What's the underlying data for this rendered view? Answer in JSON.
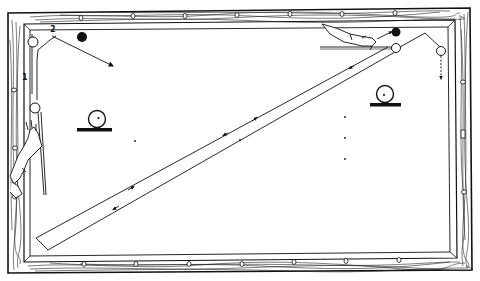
{
  "diagram": {
    "type": "billiard-table-shot-illustration",
    "colors": {
      "ink": "#111111",
      "background": "#ffffff",
      "rail_wood": "#ffffff",
      "grain": "#222222"
    },
    "labels": {
      "path_1": "1",
      "path_2": "2"
    },
    "elements": {
      "table": "billiard-table",
      "rails": "wooden-rails",
      "diamonds_top": 9,
      "diamonds_bottom": 9,
      "diamonds_left": 3,
      "diamonds_right": 3,
      "spot_markers": [
        "head-spot",
        "foot-spot",
        "center-spot",
        "side-spots"
      ],
      "balls": [
        "white-cue-ball-left",
        "black-object-ball-top-left",
        "white-ball-top-right",
        "black-ball-top-right",
        "white-ball-right-rail"
      ],
      "position_markers": [
        "ball-on-line-left",
        "ball-on-line-right"
      ],
      "hands": [
        "left-hand-with-cue",
        "right-hand-with-cue"
      ]
    }
  }
}
